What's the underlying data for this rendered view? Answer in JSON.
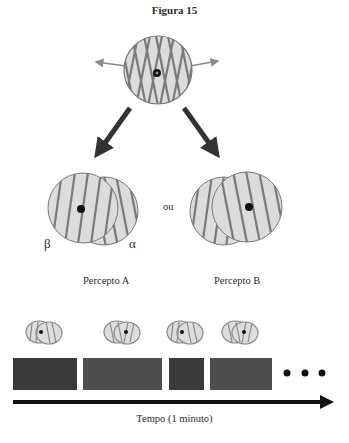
{
  "figure": {
    "title": "Figura 15",
    "connector_word": "ou",
    "percepts": [
      {
        "label": "Percepto A",
        "left_symbol": "β",
        "right_symbol": "α"
      },
      {
        "label": "Percepto B"
      }
    ],
    "timeline": {
      "axis_label": "Tempo (1 minuto)",
      "segments": [
        {
          "percept": "A",
          "color": "#3a3a3a"
        },
        {
          "percept": "B",
          "color": "#4e4e4e"
        },
        {
          "percept": "A",
          "color": "#3a3a3a"
        },
        {
          "percept": "B",
          "color": "#4e4e4e"
        }
      ],
      "continuation": "..."
    }
  },
  "colors": {
    "grating_fill": "#dcdcdc",
    "grating_stripe": "#7a7a7a",
    "arrow_dark": "#333333",
    "arrow_gray": "#8a8a8a"
  }
}
